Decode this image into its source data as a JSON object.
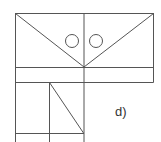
{
  "figure": {
    "label": "d)",
    "stroke_color": "#555555",
    "background": "#ffffff"
  }
}
